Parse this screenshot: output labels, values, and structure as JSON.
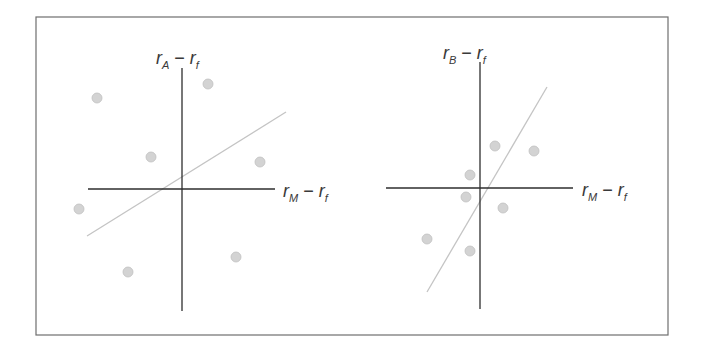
{
  "figure": {
    "frame": {
      "x": 36,
      "y": 17,
      "width": 632,
      "height": 318,
      "stroke": "#6e6e6e"
    },
    "colors": {
      "axis": "#2e2e2e",
      "regression_line": "#c4c4c4",
      "point_fill": "#d3d3d3",
      "point_stroke": "#c0c0c0",
      "label": "#3a3a3a"
    }
  },
  "chart_data": [
    {
      "type": "scatter",
      "title": "",
      "ylabel": "r_A − r_f",
      "ylabel_parts": {
        "main": "r",
        "sub": "A",
        "minus": " − ",
        "main2": "r",
        "sub2": "f"
      },
      "xlabel": "r_M − r_f",
      "xlabel_parts": {
        "main": "r",
        "sub": "M",
        "minus": " − ",
        "main2": "r",
        "sub2": "f"
      },
      "grid": false,
      "legend": null,
      "axes_origin_px": {
        "x": 182,
        "y": 189
      },
      "x_axis_px": {
        "x1": 88,
        "x2": 275,
        "y": 189
      },
      "y_axis_px": {
        "x": 182,
        "y1": 68,
        "y2": 311
      },
      "ylabel_pos": {
        "x": 156,
        "y": 64
      },
      "xlabel_pos": {
        "x": 283,
        "y": 197
      },
      "regression_line_px": {
        "x1": 87,
        "y1": 236,
        "x2": 286,
        "y2": 112
      },
      "description": "Weak positive relationship; points widely scattered around a shallow regression line (low R², low beta).",
      "points_px": [
        {
          "x": 97,
          "y": 98
        },
        {
          "x": 208,
          "y": 84
        },
        {
          "x": 151,
          "y": 157
        },
        {
          "x": 260,
          "y": 162
        },
        {
          "x": 79,
          "y": 209
        },
        {
          "x": 236,
          "y": 257
        },
        {
          "x": 128,
          "y": 272
        }
      ],
      "points_relative": [
        {
          "x": -85,
          "y": 91
        },
        {
          "x": 26,
          "y": 105
        },
        {
          "x": -31,
          "y": 32
        },
        {
          "x": 78,
          "y": 27
        },
        {
          "x": -103,
          "y": -20
        },
        {
          "x": 54,
          "y": -68
        },
        {
          "x": -54,
          "y": -83
        }
      ]
    },
    {
      "type": "scatter",
      "title": "",
      "ylabel": "r_B − r_f",
      "ylabel_parts": {
        "main": "r",
        "sub": "B",
        "minus": " − ",
        "main2": "r",
        "sub2": "f"
      },
      "xlabel": "r_M − r_f",
      "xlabel_parts": {
        "main": "r",
        "sub": "M",
        "minus": " − ",
        "main2": "r",
        "sub2": "f"
      },
      "grid": false,
      "legend": null,
      "axes_origin_px": {
        "x": 480,
        "y": 188
      },
      "x_axis_px": {
        "x1": 386,
        "x2": 573,
        "y": 188
      },
      "y_axis_px": {
        "x": 480,
        "y1": 62,
        "y2": 309
      },
      "ylabel_pos": {
        "x": 443,
        "y": 59
      },
      "xlabel_pos": {
        "x": 582,
        "y": 196
      },
      "regression_line_px": {
        "x1": 427,
        "y1": 292,
        "x2": 547,
        "y2": 87
      },
      "description": "Strong positive relationship; points tightly clustered around a steep regression line (high R², high beta).",
      "points_px": [
        {
          "x": 495,
          "y": 146
        },
        {
          "x": 534,
          "y": 151
        },
        {
          "x": 470,
          "y": 175
        },
        {
          "x": 466,
          "y": 197
        },
        {
          "x": 503,
          "y": 208
        },
        {
          "x": 427,
          "y": 239
        },
        {
          "x": 470,
          "y": 251
        }
      ],
      "points_relative": [
        {
          "x": 15,
          "y": 42
        },
        {
          "x": 54,
          "y": 37
        },
        {
          "x": -10,
          "y": 13
        },
        {
          "x": -14,
          "y": -9
        },
        {
          "x": 23,
          "y": -20
        },
        {
          "x": -53,
          "y": -51
        },
        {
          "x": -10,
          "y": -63
        }
      ]
    }
  ]
}
